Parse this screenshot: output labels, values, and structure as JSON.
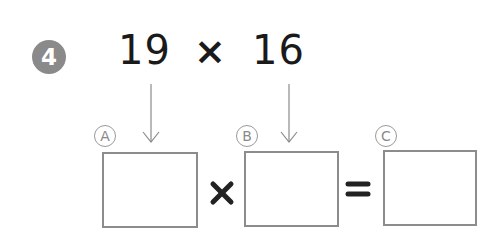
{
  "problem": {
    "number": "4",
    "factor_a": "19",
    "operator_top": "×",
    "factor_b": "16"
  },
  "labels": {
    "a": "A",
    "b": "B",
    "c": "C"
  },
  "answer_row": {
    "times": "×",
    "equals": "=",
    "box_a_value": "",
    "box_b_value": "",
    "box_c_value": ""
  },
  "colors": {
    "badge": "#8a8a8a",
    "box_border": "#8c8c8c",
    "text": "#1a1a1a"
  }
}
